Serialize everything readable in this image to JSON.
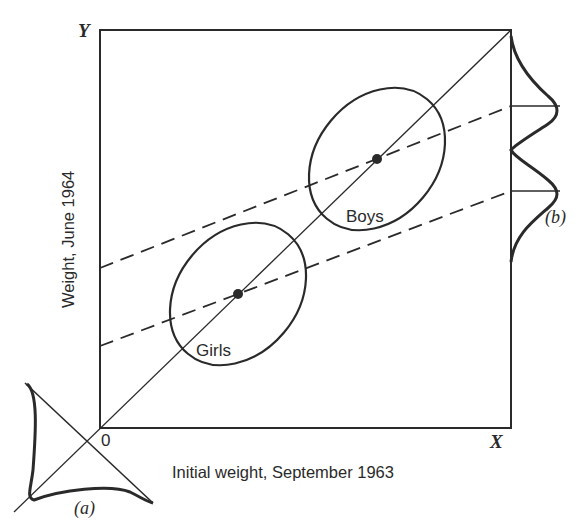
{
  "figure": {
    "axes": {
      "x_label": "Initial weight, September 1963",
      "y_label": "Weight, June 1964",
      "x_axis_letter": "X",
      "y_axis_letter": "Y",
      "origin_label": "0"
    },
    "groups": [
      {
        "name": "Girls",
        "label": "Girls"
      },
      {
        "name": "Boys",
        "label": "Boys"
      }
    ],
    "panel_labels": {
      "a": "(a)",
      "b": "(b)"
    },
    "colors": {
      "ink": "#2a2a2a",
      "background": "#ffffff"
    }
  }
}
